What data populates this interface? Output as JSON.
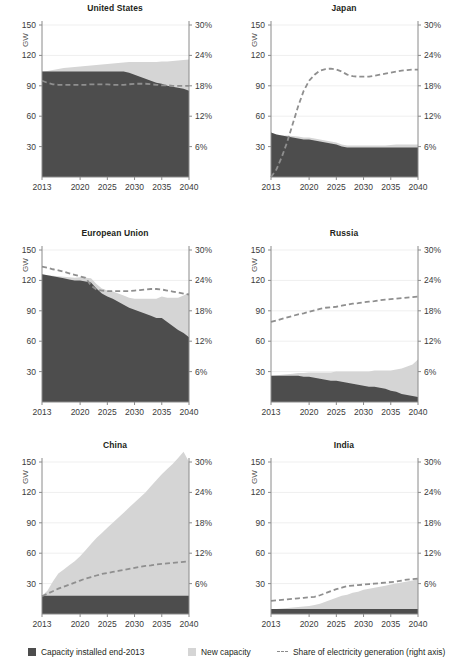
{
  "figure": {
    "colors": {
      "installed": "#4d4d4d",
      "new_capacity": "#d5d5d5",
      "share_line": "#8f8f8f",
      "axis": "#8a8a8a",
      "grid": "#efefef",
      "text": "#231f20"
    },
    "legend": {
      "installed_label": "Capacity installed end-2013",
      "new_capacity_label": "New capacity",
      "share_label": "Share of electricity generation (right axis)"
    },
    "axis": {
      "ylabel": "GW",
      "yticks": [
        "30",
        "60",
        "90",
        "120",
        "150"
      ],
      "ytick_values": [
        30,
        60,
        90,
        120,
        150
      ],
      "ylim": [
        0,
        150
      ],
      "rticks": [
        "6%",
        "12%",
        "18%",
        "24%",
        "30%"
      ],
      "rtick_values": [
        6,
        12,
        18,
        24,
        30
      ],
      "rlim": [
        0,
        30
      ],
      "xticks": [
        "2013",
        "2020",
        "2025",
        "2030",
        "2035",
        "2040"
      ],
      "xtick_values": [
        2013,
        2020,
        2025,
        2030,
        2035,
        2040
      ],
      "xlim": [
        2013,
        2040
      ],
      "grid": true,
      "legend_position": "bottom"
    }
  },
  "chart_data": [
    {
      "type": "area",
      "title": "United States",
      "xlabel": "",
      "ylabel": "GW",
      "ylim": [
        0,
        150
      ],
      "rylim": [
        0,
        30
      ],
      "x": [
        2013,
        2014,
        2015,
        2016,
        2017,
        2018,
        2019,
        2020,
        2021,
        2022,
        2023,
        2024,
        2025,
        2026,
        2027,
        2028,
        2029,
        2030,
        2031,
        2032,
        2033,
        2034,
        2035,
        2036,
        2037,
        2038,
        2039,
        2040
      ],
      "series": [
        {
          "name": "Capacity installed end-2013",
          "values": [
            104,
            104,
            104,
            104,
            104,
            104,
            104,
            104,
            104,
            104,
            104,
            104,
            104,
            104,
            104,
            104,
            103,
            101,
            99,
            97,
            95,
            93,
            92,
            90,
            89,
            88,
            87,
            85
          ]
        },
        {
          "name": "New capacity",
          "values": [
            0,
            0.5,
            1.5,
            2.5,
            3.5,
            4,
            4.5,
            5,
            5.5,
            6,
            6.5,
            7,
            7.5,
            8,
            8.5,
            9,
            10.5,
            12.5,
            14.5,
            16.5,
            18.5,
            20.5,
            22,
            24,
            25.5,
            27,
            28.5,
            31
          ]
        }
      ],
      "share_line": {
        "name": "Share of electricity generation (right axis)",
        "unit": "%",
        "values": [
          19.0,
          18.6,
          18.3,
          18.2,
          18.2,
          18.2,
          18.2,
          18.2,
          18.2,
          18.3,
          18.3,
          18.3,
          18.3,
          18.2,
          18.2,
          18.2,
          18.3,
          18.4,
          18.4,
          18.4,
          18.3,
          18.2,
          18.1,
          18.1,
          18.0,
          18.0,
          18.0,
          18.0
        ]
      }
    },
    {
      "type": "area",
      "title": "Japan",
      "xlabel": "",
      "ylabel": "GW",
      "ylim": [
        0,
        150
      ],
      "rylim": [
        0,
        30
      ],
      "x": [
        2013,
        2014,
        2015,
        2016,
        2017,
        2018,
        2019,
        2020,
        2021,
        2022,
        2023,
        2024,
        2025,
        2026,
        2027,
        2028,
        2029,
        2030,
        2031,
        2032,
        2033,
        2034,
        2035,
        2036,
        2037,
        2038,
        2039,
        2040
      ],
      "series": [
        {
          "name": "Capacity installed end-2013",
          "values": [
            44,
            42,
            41,
            40,
            39,
            38,
            37,
            37,
            36,
            35,
            34,
            33,
            32,
            30,
            29,
            29,
            29,
            29,
            29,
            29,
            29,
            29,
            29,
            29,
            29,
            29,
            29,
            29
          ]
        },
        {
          "name": "New capacity",
          "values": [
            0,
            0,
            0,
            1,
            1.5,
            2,
            2,
            2,
            2,
            2,
            2,
            2,
            2,
            2,
            2,
            2,
            2,
            2,
            2,
            2,
            2,
            2,
            2.5,
            3,
            3,
            3,
            3,
            3
          ]
        }
      ],
      "share_line": {
        "name": "Share of electricity generation (right axis)",
        "unit": "%",
        "values": [
          0.0,
          1.5,
          4.0,
          7.0,
          10.5,
          14.0,
          17.0,
          19.0,
          20.2,
          21.0,
          21.3,
          21.4,
          21.2,
          20.8,
          20.2,
          19.9,
          19.8,
          19.8,
          19.8,
          20.0,
          20.2,
          20.4,
          20.6,
          20.8,
          21.0,
          21.1,
          21.2,
          21.2
        ]
      }
    },
    {
      "type": "area",
      "title": "European Union",
      "xlabel": "",
      "ylabel": "GW",
      "ylim": [
        0,
        150
      ],
      "rylim": [
        0,
        30
      ],
      "x": [
        2013,
        2014,
        2015,
        2016,
        2017,
        2018,
        2019,
        2020,
        2021,
        2022,
        2023,
        2024,
        2025,
        2026,
        2027,
        2028,
        2029,
        2030,
        2031,
        2032,
        2033,
        2034,
        2035,
        2036,
        2037,
        2038,
        2039,
        2040
      ],
      "series": [
        {
          "name": "Capacity installed end-2013",
          "values": [
            126,
            125,
            124,
            123,
            122,
            121,
            120,
            120,
            119,
            118,
            112,
            107,
            104,
            102,
            99,
            96,
            93,
            91,
            89,
            87,
            85,
            83,
            83,
            79,
            75,
            71,
            68,
            64
          ]
        },
        {
          "name": "New capacity",
          "values": [
            0,
            0,
            0.5,
            1,
            1.5,
            2,
            2.5,
            3,
            3.5,
            4,
            4.5,
            5,
            6,
            7,
            8,
            9,
            10,
            11,
            13,
            15,
            17,
            19,
            21,
            24,
            28,
            32,
            37,
            44
          ]
        }
      ],
      "share_line": {
        "name": "Share of electricity generation (right axis)",
        "unit": "%",
        "values": [
          26.7,
          26.5,
          26.2,
          26.0,
          25.7,
          25.4,
          25.1,
          24.8,
          24.5,
          23.0,
          22.2,
          22.0,
          21.9,
          21.9,
          21.9,
          21.9,
          21.9,
          22.0,
          22.1,
          22.2,
          22.3,
          22.3,
          22.2,
          22.0,
          21.8,
          21.6,
          21.4,
          21.2
        ]
      }
    },
    {
      "type": "area",
      "title": "Russia",
      "xlabel": "",
      "ylabel": "GW",
      "ylim": [
        0,
        150
      ],
      "rylim": [
        0,
        30
      ],
      "x": [
        2013,
        2014,
        2015,
        2016,
        2017,
        2018,
        2019,
        2020,
        2021,
        2022,
        2023,
        2024,
        2025,
        2026,
        2027,
        2028,
        2029,
        2030,
        2031,
        2032,
        2033,
        2034,
        2035,
        2036,
        2037,
        2038,
        2039,
        2040
      ],
      "series": [
        {
          "name": "Capacity installed end-2013",
          "values": [
            26,
            26,
            26,
            26,
            26,
            26,
            25,
            25,
            24,
            23,
            22,
            21,
            21,
            20,
            19,
            18,
            17,
            16,
            15,
            15,
            14,
            13,
            11,
            10,
            8,
            7,
            6,
            5
          ]
        },
        {
          "name": "New capacity",
          "values": [
            0,
            0.5,
            1,
            1.5,
            2,
            2.5,
            3.5,
            4,
            5,
            6,
            7,
            8,
            9,
            10,
            11,
            12,
            13,
            14,
            15,
            16,
            17,
            18,
            20,
            22,
            25,
            28,
            31,
            37
          ]
        }
      ],
      "share_line": {
        "name": "Share of electricity generation (right axis)",
        "unit": "%",
        "values": [
          15.8,
          16.1,
          16.4,
          16.7,
          17.0,
          17.3,
          17.5,
          17.8,
          18.1,
          18.4,
          18.6,
          18.7,
          18.8,
          19.0,
          19.2,
          19.4,
          19.5,
          19.7,
          19.8,
          19.9,
          20.1,
          20.2,
          20.3,
          20.4,
          20.5,
          20.6,
          20.7,
          20.8
        ]
      }
    },
    {
      "type": "area",
      "title": "China",
      "xlabel": "",
      "ylabel": "GW",
      "ylim": [
        0,
        150
      ],
      "rylim": [
        0,
        30
      ],
      "x": [
        2013,
        2014,
        2015,
        2016,
        2017,
        2018,
        2019,
        2020,
        2021,
        2022,
        2023,
        2024,
        2025,
        2026,
        2027,
        2028,
        2029,
        2030,
        2031,
        2032,
        2033,
        2034,
        2035,
        2036,
        2037,
        2038,
        2039,
        2040
      ],
      "series": [
        {
          "name": "Capacity installed end-2013",
          "values": [
            18,
            18,
            18,
            18,
            18,
            18,
            18,
            18,
            18,
            18,
            18,
            18,
            18,
            18,
            18,
            18,
            18,
            18,
            18,
            18,
            18,
            18,
            18,
            18,
            18,
            18,
            18,
            18
          ]
        },
        {
          "name": "New capacity",
          "values": [
            0,
            5,
            14,
            22,
            26,
            30,
            34,
            39,
            45,
            51,
            57,
            62,
            67,
            72,
            77,
            82,
            87,
            92,
            97,
            102,
            108,
            114,
            120,
            125,
            130,
            136,
            142,
            132
          ]
        }
      ],
      "share_line": {
        "name": "Share of electricity generation (right axis)",
        "unit": "%",
        "values": [
          3.5,
          4.0,
          4.5,
          5.0,
          5.4,
          5.8,
          6.2,
          6.6,
          7.0,
          7.3,
          7.6,
          7.9,
          8.1,
          8.3,
          8.5,
          8.7,
          8.9,
          9.1,
          9.3,
          9.5,
          9.6,
          9.8,
          9.9,
          10.0,
          10.1,
          10.2,
          10.3,
          10.4
        ]
      }
    },
    {
      "type": "area",
      "title": "India",
      "xlabel": "",
      "ylabel": "GW",
      "ylim": [
        0,
        150
      ],
      "rylim": [
        0,
        30
      ],
      "x": [
        2013,
        2014,
        2015,
        2016,
        2017,
        2018,
        2019,
        2020,
        2021,
        2022,
        2023,
        2024,
        2025,
        2026,
        2027,
        2028,
        2029,
        2030,
        2031,
        2032,
        2033,
        2034,
        2035,
        2036,
        2037,
        2038,
        2039,
        2040
      ],
      "series": [
        {
          "name": "Capacity installed end-2013",
          "values": [
            5,
            5,
            5,
            5,
            5,
            5,
            5,
            5,
            5,
            5,
            5,
            5,
            5,
            5,
            5,
            5,
            5,
            5,
            5,
            5,
            5,
            5,
            5,
            5,
            5,
            5,
            5,
            5
          ]
        },
        {
          "name": "New capacity",
          "values": [
            0,
            0,
            0.5,
            1,
            1.5,
            2,
            2.5,
            3,
            4,
            5,
            7,
            9,
            11,
            13,
            14,
            16,
            17,
            19,
            20,
            21,
            22,
            23,
            24,
            25,
            26,
            27,
            28,
            30
          ]
        }
      ],
      "share_line": {
        "name": "Share of electricity generation (right axis)",
        "unit": "%",
        "values": [
          2.6,
          2.7,
          2.8,
          2.9,
          3.0,
          3.1,
          3.2,
          3.3,
          3.4,
          3.7,
          4.1,
          4.5,
          4.9,
          5.2,
          5.5,
          5.6,
          5.7,
          5.8,
          5.9,
          6.0,
          6.1,
          6.2,
          6.3,
          6.4,
          6.6,
          6.8,
          6.9,
          7.0
        ]
      }
    }
  ]
}
